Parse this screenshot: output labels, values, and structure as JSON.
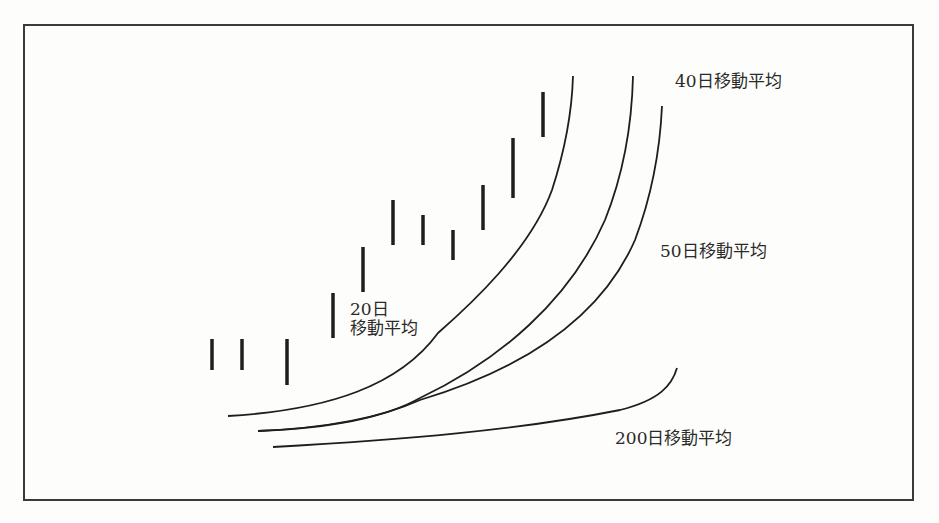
{
  "figure": {
    "labels": {
      "ma20_line1": "20日",
      "ma20_line2": "移動平均",
      "ma40": "40日移動平均",
      "ma50": "50日移動平均",
      "ma200": "200日移動平均"
    }
  },
  "chart_data": {
    "type": "line",
    "title": "",
    "xlabel": "",
    "ylabel": "",
    "grid": false,
    "legend": "inline annotations",
    "price_bars": [
      {
        "x": 212,
        "high": 339,
        "low": 370
      },
      {
        "x": 242,
        "high": 339,
        "low": 370
      },
      {
        "x": 287,
        "high": 339,
        "low": 385
      },
      {
        "x": 333,
        "high": 293,
        "low": 338
      },
      {
        "x": 363,
        "high": 247,
        "low": 292
      },
      {
        "x": 393,
        "high": 200,
        "low": 245
      },
      {
        "x": 423,
        "high": 215,
        "low": 245
      },
      {
        "x": 453,
        "high": 230,
        "low": 260
      },
      {
        "x": 483,
        "high": 185,
        "low": 230
      },
      {
        "x": 513,
        "high": 138,
        "low": 198
      },
      {
        "x": 543,
        "high": 92,
        "low": 137
      }
    ],
    "series": [
      {
        "name": "20日移動平均",
        "path": "M228,416 C330,410 400,385 438,333 C470,305 530,250 552,190 C565,150 572,110 573,76"
      },
      {
        "name": "40日移動平均",
        "path": "M258,431 C340,428 390,415 420,398 C500,360 570,300 605,220 C625,170 632,120 633,76"
      },
      {
        "name": "50日移動平均",
        "path": "M258,431 C330,428 380,418 420,400 C520,370 600,320 635,240 C652,195 660,150 662,106"
      },
      {
        "name": "200日移動平均",
        "path": "M273,447 C400,440 520,430 620,410 C660,400 672,385 677,368"
      }
    ],
    "note": "Coordinates are in screenshot pixel space (y increases downward); conceptual diagram with no numeric axes."
  }
}
